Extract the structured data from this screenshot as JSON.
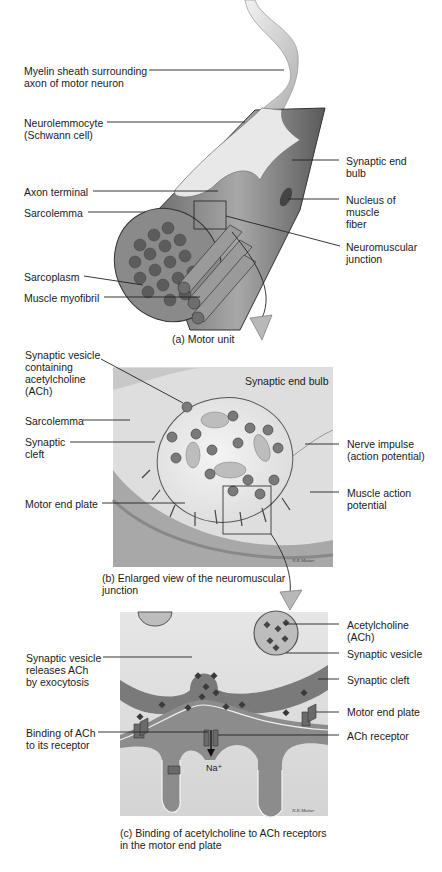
{
  "panel_a": {
    "caption": "(a) Motor unit",
    "labels": {
      "myelin": "Myelin sheath surrounding\naxon of motor neuron",
      "neurolemmocyte": "Neurolemmocyte\n(Schwann cell)",
      "axon_terminal": "Axon terminal",
      "sarcolemma": "Sarcolemma",
      "sarcoplasm": "Sarcoplasm",
      "myofibril": "Muscle myofibril",
      "synaptic_end_bulb": "Synaptic end\nbulb",
      "nucleus": "Nucleus of\nmuscle\nfiber",
      "nmj": "Neuromuscular\njunction"
    }
  },
  "panel_b": {
    "caption": "(b) Enlarged view of the neuromuscular\n      junction",
    "labels": {
      "vesicle": "Synaptic vesicle\ncontaining\nacetylcholine\n(ACh)",
      "sarcolemma": "Sarcolemma",
      "cleft": "Synaptic\ncleft",
      "motor_end_plate": "Motor end plate",
      "end_bulb": "Synaptic end bulb",
      "nerve_impulse": "Nerve impulse\n(action potential)",
      "muscle_ap": "Muscle action\npotential"
    }
  },
  "panel_c": {
    "caption": "(c) Binding of acetylcholine to ACh receptors\n      in the motor end plate",
    "labels": {
      "releases": "Synaptic vesicle\nreleases ACh\nby exocytosis",
      "binding": "Binding of ACh\nto its receptor",
      "ach": "Acetylcholine\n(ACh)",
      "vesicle": "Synaptic vesicle",
      "cleft": "Synaptic cleft",
      "motor_end_plate": "Motor end plate",
      "receptor": "ACh receptor",
      "na": "Na⁺"
    }
  },
  "colors": {
    "ink": "#1a1a1a",
    "tissue_light": "#e4e4e4",
    "tissue_mid": "#9a9a9a",
    "tissue_dark": "#555555",
    "arrow_fill": "#b8b8b8"
  }
}
